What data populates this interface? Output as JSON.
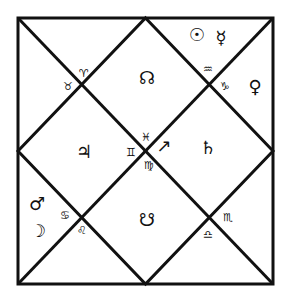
{
  "chart": {
    "style": "North Indian",
    "line_color": "#111111",
    "background": "#ffffff"
  },
  "signs": [
    {
      "name": "aries",
      "glyph": "♈",
      "x": 84,
      "y": 73
    },
    {
      "name": "taurus",
      "glyph": "♉",
      "x": 68,
      "y": 86
    },
    {
      "name": "aquarius",
      "glyph": "♒",
      "x": 208,
      "y": 69
    },
    {
      "name": "capricorn",
      "glyph": "♑",
      "x": 225,
      "y": 86
    },
    {
      "name": "pisces",
      "glyph": "♓",
      "x": 146,
      "y": 137
    },
    {
      "name": "gemini",
      "glyph": "♊",
      "x": 131,
      "y": 152
    },
    {
      "name": "virgo",
      "glyph": "♍",
      "x": 149,
      "y": 165
    },
    {
      "name": "cancer",
      "glyph": "♋",
      "x": 65,
      "y": 215
    },
    {
      "name": "leo",
      "glyph": "♌",
      "x": 82,
      "y": 230
    },
    {
      "name": "scorpio",
      "glyph": "♏",
      "x": 228,
      "y": 217
    },
    {
      "name": "libra",
      "glyph": "♎",
      "x": 208,
      "y": 234
    }
  ],
  "planets": [
    {
      "name": "sun",
      "glyph": "☉",
      "x": 197,
      "y": 35
    },
    {
      "name": "mercury",
      "glyph": "☿",
      "x": 221,
      "y": 38
    },
    {
      "name": "venus",
      "glyph": "♀",
      "x": 255,
      "y": 87
    },
    {
      "name": "rahu",
      "glyph": "☊",
      "x": 147,
      "y": 78
    },
    {
      "name": "jupiter",
      "glyph": "♃",
      "x": 84,
      "y": 152
    },
    {
      "name": "saturn",
      "glyph": "♄",
      "x": 208,
      "y": 148
    },
    {
      "name": "ascendant-arrow",
      "glyph": "↗",
      "x": 164,
      "y": 146
    },
    {
      "name": "mars",
      "glyph": "♂",
      "x": 37,
      "y": 204
    },
    {
      "name": "moon",
      "glyph": "☽",
      "x": 38,
      "y": 231
    },
    {
      "name": "ketu",
      "glyph": "☋",
      "x": 147,
      "y": 220
    }
  ]
}
